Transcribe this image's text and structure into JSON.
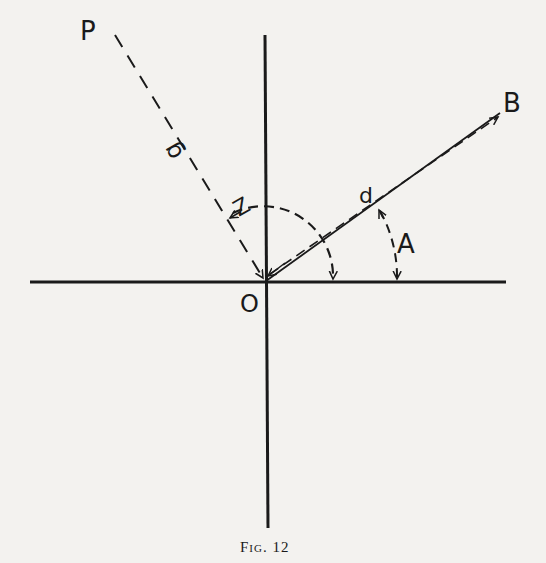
{
  "figure": {
    "caption": "Fig. 12",
    "labels": {
      "P": "P",
      "B": "B",
      "O": "O",
      "A": "A",
      "Z": "Z",
      "d": "d",
      "g": "g"
    }
  },
  "diagram": {
    "elements": [
      {
        "type": "axis",
        "name": "horizontal-axis"
      },
      {
        "type": "axis",
        "name": "vertical-axis"
      },
      {
        "type": "vector",
        "name": "OB",
        "style": "solid with parallel dashed arrow",
        "label": "d"
      },
      {
        "type": "vector",
        "name": "PO",
        "style": "dashed",
        "label": "g"
      },
      {
        "type": "arc",
        "name": "angle-Z",
        "style": "dashed",
        "from": "OP direction",
        "to": "horizontal axis"
      },
      {
        "type": "arc",
        "name": "angle-A",
        "style": "dashed",
        "from": "OB",
        "to": "horizontal axis"
      }
    ]
  }
}
